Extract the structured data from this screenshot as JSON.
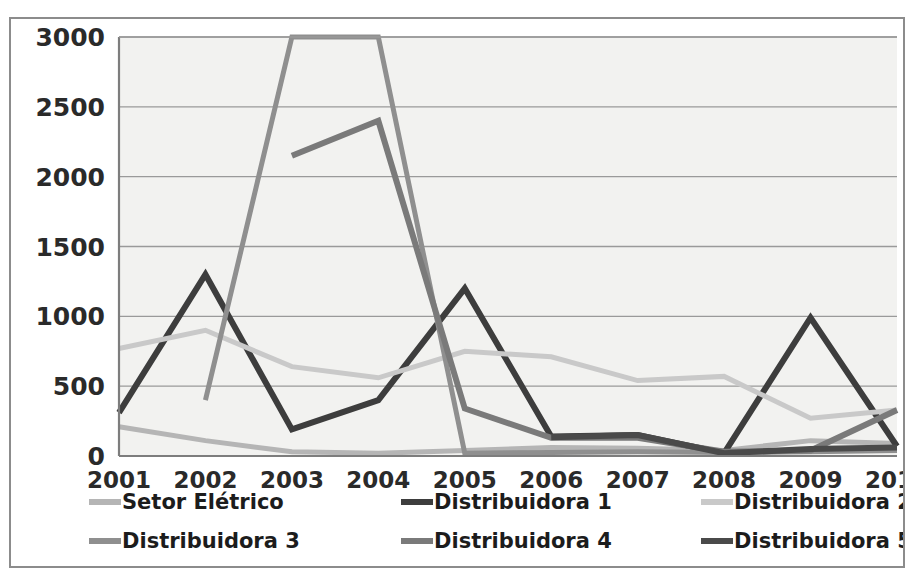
{
  "chart_data": {
    "type": "line",
    "title": "",
    "subtitle": "",
    "xlabel": "",
    "ylabel": "",
    "categories": [
      "2001",
      "2002",
      "2003",
      "2004",
      "2005",
      "2006",
      "2007",
      "2008",
      "2009",
      "2010"
    ],
    "x": [
      2001,
      2002,
      2003,
      2004,
      2005,
      2006,
      2007,
      2008,
      2009,
      2010
    ],
    "ylim": [
      0,
      3000
    ],
    "yticks": [
      0,
      500,
      1000,
      1500,
      2000,
      2500,
      3000
    ],
    "ytick_labels": [
      "0",
      "500",
      "1000",
      "1500",
      "2000",
      "2500",
      "3000"
    ],
    "grid": true,
    "legend_position": "bottom",
    "note": "Values above 3000 are clipped by the axis maximum",
    "series": [
      {
        "name": "Setor Elétrico",
        "color": "#b5b5b5",
        "width": 5,
        "values": [
          210,
          110,
          30,
          20,
          40,
          60,
          55,
          40,
          110,
          90
        ]
      },
      {
        "name": "Distribuidora 1",
        "color": "#3d3d3d",
        "width": 6,
        "values": [
          310,
          1300,
          190,
          400,
          1200,
          140,
          150,
          20,
          990,
          70
        ]
      },
      {
        "name": "Distribuidora 2",
        "color": "#c9c9c9",
        "width": 5,
        "values": [
          770,
          900,
          640,
          560,
          750,
          710,
          540,
          570,
          270,
          330
        ]
      },
      {
        "name": "Distribuidora 3",
        "color": "#8f8f8f",
        "width": 5,
        "values": [
          null,
          400,
          3000,
          3000,
          20,
          25,
          30,
          25,
          30,
          40
        ]
      },
      {
        "name": "Distribuidora 4",
        "color": "#7a7a7a",
        "width": 6,
        "values": [
          null,
          null,
          2150,
          2400,
          340,
          130,
          130,
          30,
          40,
          330
        ]
      },
      {
        "name": "Distribuidora 5",
        "color": "#4a4a4a",
        "width": 6,
        "values": [
          null,
          null,
          null,
          null,
          null,
          135,
          150,
          20,
          50,
          60
        ]
      }
    ]
  },
  "legend": {
    "entries": [
      {
        "label": "Setor Elétrico",
        "color": "#b5b5b5"
      },
      {
        "label": "Distribuidora 1",
        "color": "#3d3d3d"
      },
      {
        "label": "Distribuidora 2",
        "color": "#c9c9c9"
      },
      {
        "label": "Distribuidora 3",
        "color": "#8f8f8f"
      },
      {
        "label": "Distribuidora 4",
        "color": "#7a7a7a"
      },
      {
        "label": "Distribuidora 5",
        "color": "#4a4a4a"
      }
    ]
  },
  "colors": {
    "plot_background": "#f2f2f0",
    "frame_border": "#8c8c8c",
    "gridline": "#9a9a9a",
    "axis": "#7d7d7d",
    "tick_text": "#2a2a2a",
    "legend_text": "#1c1c1c"
  }
}
